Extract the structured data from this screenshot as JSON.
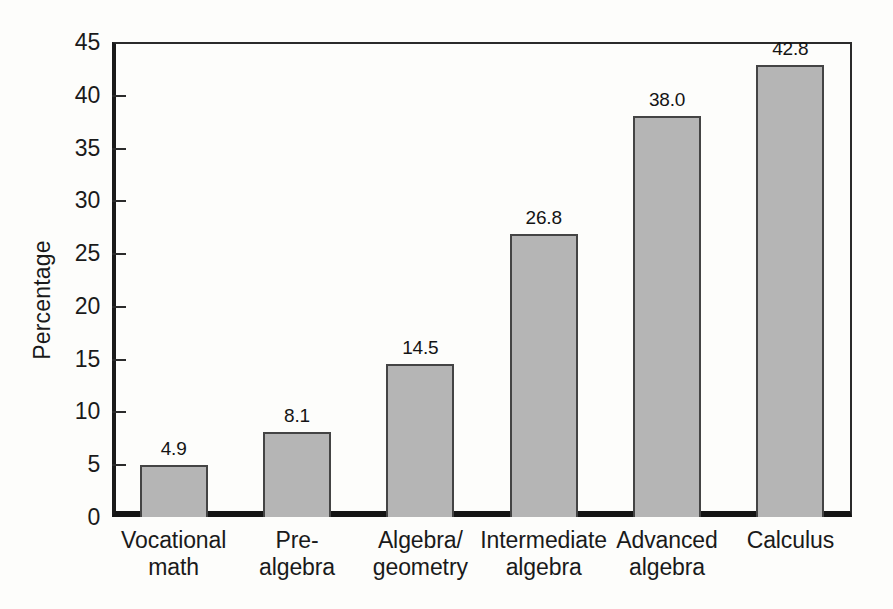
{
  "chart_data": {
    "type": "bar",
    "title": "",
    "subtitle": "",
    "xlabel": "",
    "ylabel": "Percentage",
    "ylim": [
      0,
      45
    ],
    "ytick_step": 5,
    "yticks": [
      "0",
      "5",
      "10",
      "15",
      "20",
      "25",
      "30",
      "35",
      "40",
      "45"
    ],
    "grid": false,
    "legend": null,
    "orientation": "vertical",
    "categories": [
      "Vocational math",
      "Pre-algebra",
      "Algebra/geometry",
      "Intermediate algebra",
      "Advanced algebra",
      "Calculus"
    ],
    "category_lines": [
      [
        "Vocational",
        "math"
      ],
      [
        "Pre-",
        "algebra"
      ],
      [
        "Algebra/",
        "geometry"
      ],
      [
        "Intermediate",
        "algebra"
      ],
      [
        "Advanced",
        "algebra"
      ],
      [
        "Calculus",
        ""
      ]
    ],
    "values": [
      4.9,
      8.1,
      14.5,
      26.8,
      38.0,
      42.8
    ],
    "value_labels": [
      "4.9",
      "8.1",
      "14.5",
      "26.8",
      "38.0",
      "42.8"
    ],
    "bar_fill_color": "#b5b5b5",
    "bar_edge_color": "#444444",
    "axis_color": "#1a1a1a",
    "background_color": "#fdfdfb"
  }
}
